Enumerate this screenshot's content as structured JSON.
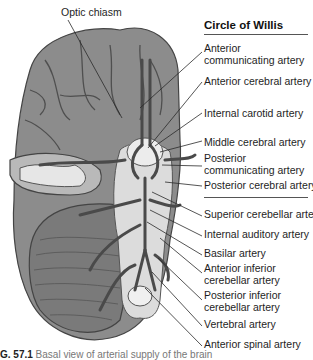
{
  "diagram": {
    "title": "Circle of Willis",
    "top_label": "Optic chiasm",
    "labels": [
      {
        "text": "Anterior\ncommunicating artery",
        "x": 204,
        "y": 43
      },
      {
        "text": "Anterior cerebral artery",
        "x": 204,
        "y": 78
      },
      {
        "text": "Internal carotid artery",
        "x": 204,
        "y": 110
      },
      {
        "text": "Middle cerebral artery",
        "x": 204,
        "y": 138
      },
      {
        "text": "Posterior\ncommunicating artery",
        "x": 204,
        "y": 156
      },
      {
        "text": "Posterior cerebral artery",
        "x": 204,
        "y": 182
      },
      {
        "text": "Superior cerebellar artery",
        "x": 204,
        "y": 212
      },
      {
        "text": "Internal auditory artery",
        "x": 204,
        "y": 232
      },
      {
        "text": "Basilar artery",
        "x": 204,
        "y": 251
      },
      {
        "text": "Anterior inferior\ncerebellar artery",
        "x": 204,
        "y": 266
      },
      {
        "text": "Posterior inferior\ncerebellar artery",
        "x": 204,
        "y": 293
      },
      {
        "text": "Vertebral artery",
        "x": 204,
        "y": 322
      },
      {
        "text": "Anterior spinal artery",
        "x": 204,
        "y": 342
      }
    ],
    "caption": {
      "figure_number": "G. 57.1",
      "text": "Basal view of arterial supply of the brain"
    },
    "colors": {
      "brain_fill": "#8a8a8a",
      "brain_dark": "#5a5a5a",
      "artery": "#4a4a4a",
      "brainstem": "#d8d8d8",
      "leader_line": "#2a2a2a"
    }
  }
}
